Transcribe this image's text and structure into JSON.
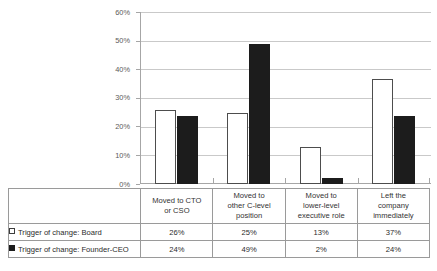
{
  "chart_data": {
    "type": "bar",
    "title": "",
    "xlabel": "",
    "ylabel": "",
    "ylim": [
      0,
      60
    ],
    "grid": true,
    "legend_position": "table-below",
    "ytick_labels": [
      "60%",
      "50%",
      "40%",
      "30%",
      "20%",
      "10%",
      "0%"
    ],
    "ytick_values": [
      60,
      50,
      40,
      30,
      20,
      10,
      0
    ],
    "categories": [
      "Moved to CTO or CSO",
      "Moved to other C-level position",
      "Moved to lower-level executive role",
      "Left the company immediately"
    ],
    "category_lines": [
      [
        "Moved to CTO",
        "or CSO"
      ],
      [
        "Moved to",
        "other C-level",
        "position"
      ],
      [
        "Moved to",
        "lower-level",
        "executive role"
      ],
      [
        "Left the",
        "company",
        "immediately"
      ]
    ],
    "series": [
      {
        "name": "Trigger of change: Board",
        "values": [
          26,
          25,
          13,
          37
        ],
        "labels": [
          "26%",
          "25%",
          "13%",
          "37%"
        ],
        "color": "#ffffff",
        "border_color": "#4d4d4d"
      },
      {
        "name": "Trigger of change: Founder-CEO",
        "values": [
          24,
          49,
          2,
          24
        ],
        "labels": [
          "24%",
          "49%",
          "2%",
          "24%"
        ],
        "color": "#1c1c1c",
        "border_color": "#1c1c1c"
      }
    ]
  },
  "colors": {
    "gridline": "#c9c9c9",
    "axis": "#a6a6a6",
    "table_border": "#9a9a9a",
    "text": "#2b2b2b",
    "tick_text": "#5a5a5a"
  }
}
